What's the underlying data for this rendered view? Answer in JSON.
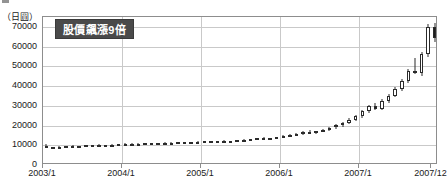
{
  "top_fragment": "",
  "chart_data": {
    "type": "candlestick",
    "title": "",
    "unit_label": "（日圓）",
    "annotation": "股價飆漲9倍",
    "xlabel": "",
    "ylabel": "",
    "ylim": [
      0,
      75000
    ],
    "yticks": [
      0,
      10000,
      20000,
      30000,
      40000,
      50000,
      60000,
      70000
    ],
    "ytick_labels": [
      "0",
      "10000",
      "20000",
      "30000",
      "40000",
      "50000",
      "60000",
      "70000"
    ],
    "xticks": [
      "2003/1",
      "2004/1",
      "2005/1",
      "2006/1",
      "2007/1",
      "2007/12"
    ],
    "xtick_positions": [
      0,
      12,
      24,
      36,
      48,
      59
    ],
    "grid": true,
    "legend": null,
    "x": [
      "2003/1",
      "2003/2",
      "2003/3",
      "2003/4",
      "2003/5",
      "2003/6",
      "2003/7",
      "2003/8",
      "2003/9",
      "2003/10",
      "2003/11",
      "2003/12",
      "2004/1",
      "2004/2",
      "2004/3",
      "2004/4",
      "2004/5",
      "2004/6",
      "2004/7",
      "2004/8",
      "2004/9",
      "2004/10",
      "2004/11",
      "2004/12",
      "2005/1",
      "2005/2",
      "2005/3",
      "2005/4",
      "2005/5",
      "2005/6",
      "2005/7",
      "2005/8",
      "2005/9",
      "2005/10",
      "2005/11",
      "2005/12",
      "2006/1",
      "2006/2",
      "2006/3",
      "2006/4",
      "2006/5",
      "2006/6",
      "2006/7",
      "2006/8",
      "2006/9",
      "2006/10",
      "2006/11",
      "2006/12",
      "2007/1",
      "2007/2",
      "2007/3",
      "2007/4",
      "2007/5",
      "2007/6",
      "2007/7",
      "2007/8",
      "2007/9",
      "2007/10",
      "2007/11",
      "2007/12"
    ],
    "series": [
      {
        "name": "股價",
        "ohlc": [
          [
            9800,
            10400,
            8400,
            8600
          ],
          [
            8600,
            9100,
            8200,
            8900
          ],
          [
            8900,
            9400,
            8600,
            9100
          ],
          [
            9100,
            9600,
            8800,
            9500
          ],
          [
            9500,
            9900,
            9200,
            9300
          ],
          [
            9300,
            9800,
            9000,
            9700
          ],
          [
            9700,
            10100,
            9400,
            9900
          ],
          [
            9900,
            10300,
            9600,
            10100
          ],
          [
            10100,
            10500,
            9700,
            9800
          ],
          [
            9800,
            10200,
            9500,
            10000
          ],
          [
            10000,
            10400,
            9800,
            10300
          ],
          [
            10300,
            10700,
            10000,
            10500
          ],
          [
            10500,
            10900,
            10200,
            10700
          ],
          [
            10700,
            11100,
            10400,
            10600
          ],
          [
            10600,
            11000,
            10300,
            10800
          ],
          [
            10800,
            11200,
            10500,
            11000
          ],
          [
            11000,
            11400,
            10700,
            10900
          ],
          [
            10900,
            11300,
            10600,
            11200
          ],
          [
            11200,
            11600,
            10900,
            11400
          ],
          [
            11400,
            11800,
            11100,
            11300
          ],
          [
            11300,
            11700,
            11000,
            11500
          ],
          [
            11500,
            11900,
            11200,
            11400
          ],
          [
            11400,
            11800,
            11100,
            11600
          ],
          [
            11600,
            12000,
            11300,
            11800
          ],
          [
            11800,
            12300,
            11500,
            12000
          ],
          [
            12000,
            12400,
            11700,
            11900
          ],
          [
            11900,
            12300,
            11600,
            12100
          ],
          [
            12100,
            12500,
            11800,
            12000
          ],
          [
            12000,
            12400,
            11700,
            12200
          ],
          [
            12200,
            12700,
            11900,
            12500
          ],
          [
            12500,
            13000,
            12200,
            12800
          ],
          [
            12800,
            13300,
            12500,
            13100
          ],
          [
            13100,
            13700,
            12800,
            13500
          ],
          [
            13500,
            14100,
            13100,
            13300
          ],
          [
            13300,
            13900,
            13000,
            13700
          ],
          [
            13700,
            14400,
            13400,
            14200
          ],
          [
            14200,
            15000,
            13800,
            14700
          ],
          [
            14700,
            15600,
            14300,
            15200
          ],
          [
            15200,
            16200,
            14800,
            15900
          ],
          [
            15900,
            17000,
            15400,
            16600
          ],
          [
            16600,
            17600,
            16000,
            16300
          ],
          [
            16300,
            17300,
            15800,
            17000
          ],
          [
            17000,
            18200,
            16500,
            17900
          ],
          [
            17900,
            19400,
            17400,
            19000
          ],
          [
            19000,
            20600,
            18400,
            20100
          ],
          [
            20100,
            21800,
            19500,
            21200
          ],
          [
            21200,
            23600,
            20600,
            23000
          ],
          [
            23000,
            25400,
            22300,
            24800
          ],
          [
            24800,
            28000,
            24000,
            27400
          ],
          [
            27400,
            30500,
            26600,
            29800
          ],
          [
            29800,
            31500,
            27900,
            28300
          ],
          [
            28300,
            33200,
            27700,
            32400
          ],
          [
            32400,
            36000,
            31600,
            35200
          ],
          [
            35200,
            39500,
            34400,
            38600
          ],
          [
            38600,
            43500,
            37700,
            42600
          ],
          [
            42600,
            48500,
            41600,
            47400
          ],
          [
            47400,
            54000,
            45900,
            46600
          ],
          [
            46600,
            57500,
            45300,
            56300
          ],
          [
            56300,
            71500,
            54900,
            69800
          ],
          [
            69800,
            72000,
            62200,
            64500
          ]
        ]
      }
    ]
  }
}
